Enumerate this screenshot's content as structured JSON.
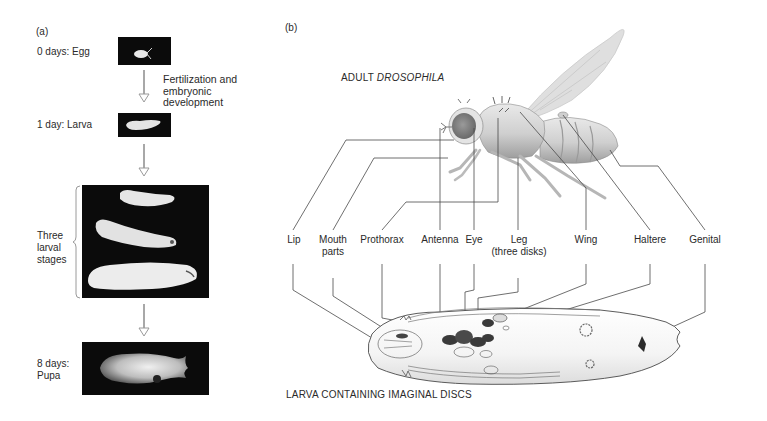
{
  "panel_a": {
    "label": "(a)",
    "stages": [
      {
        "id": "egg",
        "label": "0 days: Egg"
      },
      {
        "id": "larva1",
        "label": "1 day: Larva"
      },
      {
        "id": "larval_stages",
        "label_lines": [
          "Three",
          "larval",
          "stages"
        ]
      },
      {
        "id": "pupa",
        "label_lines": [
          "8 days:",
          "Pupa"
        ]
      }
    ],
    "transition_note_lines": [
      "Fertilization and",
      "embryonic",
      "development"
    ]
  },
  "panel_b": {
    "label": "(b)",
    "adult_title_prefix": "ADULT ",
    "adult_title_species": "DROSOPHILA",
    "larva_title": "LARVA CONTAINING IMAGINAL DISCS",
    "structures": [
      {
        "id": "lip",
        "lines": [
          "Lip"
        ]
      },
      {
        "id": "mouth_parts",
        "lines": [
          "Mouth",
          "parts"
        ]
      },
      {
        "id": "prothorax",
        "lines": [
          "Prothorax"
        ]
      },
      {
        "id": "antenna",
        "lines": [
          "Antenna"
        ]
      },
      {
        "id": "eye",
        "lines": [
          "Eye"
        ]
      },
      {
        "id": "leg",
        "lines": [
          "Leg",
          "(three disks)"
        ]
      },
      {
        "id": "wing",
        "lines": [
          "Wing"
        ]
      },
      {
        "id": "haltere",
        "lines": [
          "Haltere"
        ]
      },
      {
        "id": "genital",
        "lines": [
          "Genital"
        ]
      }
    ]
  },
  "colors": {
    "text": "#2a2a2a",
    "leader_line": "#4a4a4a",
    "photo_bg": "#0b0b0b",
    "arrow": "#9a9a9a",
    "disc_dark": "#3a3a3a"
  }
}
